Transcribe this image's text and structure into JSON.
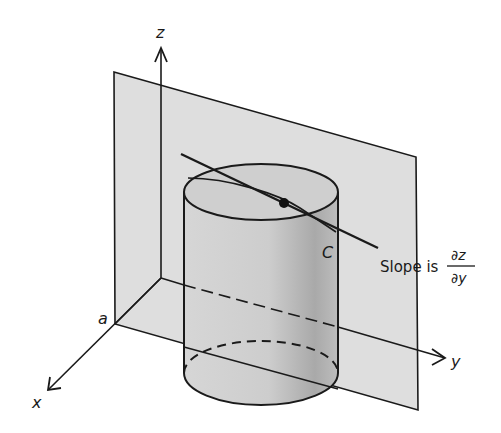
{
  "figure": {
    "labels": {
      "z_axis": "z",
      "y_axis": "y",
      "x_axis": "x",
      "a_label": "a",
      "curve_label": "C",
      "slope_prefix": "Slope is",
      "slope_numerator": "∂z",
      "slope_denominator": "∂y"
    },
    "colors": {
      "plane_fill": "#dcdcdc",
      "cylinder_fill": "#c8c8c8",
      "cylinder_shade": "#a8a8a8",
      "stroke": "#1a1a1a",
      "background": "#ffffff"
    }
  }
}
